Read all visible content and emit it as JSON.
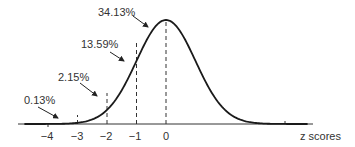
{
  "chart_data": {
    "type": "line",
    "title": "",
    "subtitle": "Standard normal distribution with area percentages",
    "xlabel": "z scores",
    "ylabel": "",
    "x_ticks": [
      -4,
      -3,
      -2,
      -1,
      0
    ],
    "x_tick_labels": [
      "−4",
      "−3",
      "−2",
      "−1",
      "0"
    ],
    "xlim": [
      -5,
      5
    ],
    "grid": false,
    "legend": null,
    "dashed_reference_lines_at": [
      -3,
      -2,
      -1,
      0
    ],
    "annotations": [
      {
        "text": "0.13%",
        "region": "z < -3",
        "value": 0.13
      },
      {
        "text": "2.15%",
        "region": "-3 < z < -2",
        "value": 2.15
      },
      {
        "text": "13.59%",
        "region": "-2 < z < -1",
        "value": 13.59
      },
      {
        "text": "34.13%",
        "region": "-1 < z < 0",
        "value": 34.13
      }
    ],
    "series": [
      {
        "name": "normal density",
        "mean": 0,
        "sd": 1
      }
    ]
  },
  "labels": {
    "a0": "0.13%",
    "a1": "2.15%",
    "a2": "13.59%",
    "a3": "34.13%",
    "t0": "−4",
    "t1": "−3",
    "t2": "−2",
    "t3": "−1",
    "t4": "0",
    "xaxis": "z scores"
  }
}
